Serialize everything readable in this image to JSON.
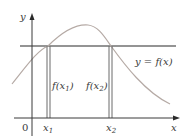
{
  "diagram": {
    "axes": {
      "y_label": "y",
      "x_label": "x",
      "origin_label": "0"
    },
    "points": {
      "x1_label": "x",
      "x1_sub": "1",
      "x2_label": "x",
      "x2_sub": "2"
    },
    "heights": {
      "f1_label_pre": "f(x",
      "f1_sub": "1",
      "f1_label_post": ")",
      "f2_label_pre": "f(x",
      "f2_sub": "2",
      "f2_label_post": ")"
    },
    "curve_label": "y = f(x)",
    "colors": {
      "curve": "#b0a7a2",
      "axis": "#3a3a3a",
      "horizontal_line": "#6a6a6a",
      "vertical_lines": "#6a6a6a"
    }
  }
}
